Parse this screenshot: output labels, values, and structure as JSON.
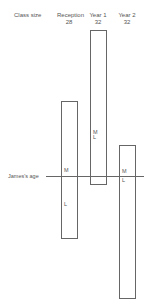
{
  "header": {
    "row_label": "Class size",
    "columns": [
      {
        "name": "Reception",
        "size": "28"
      },
      {
        "name": "Year 1",
        "size": "32"
      },
      {
        "name": "Year 2",
        "size": "32"
      }
    ]
  },
  "line": {
    "label": "James's age"
  },
  "bars": [
    {
      "name": "Reception",
      "markers": [
        {
          "text": "M"
        },
        {
          "text": "L"
        }
      ]
    },
    {
      "name": "Year 1",
      "markers": [
        {
          "text": "M"
        },
        {
          "text": "L"
        }
      ]
    },
    {
      "name": "Year 2",
      "markers": [
        {
          "text": "M"
        },
        {
          "text": "L"
        }
      ]
    }
  ]
}
